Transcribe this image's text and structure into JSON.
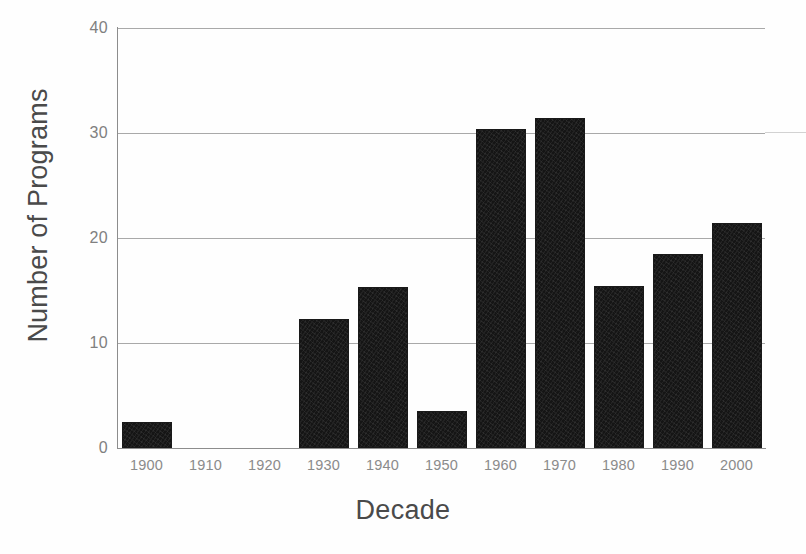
{
  "chart_data": {
    "type": "bar",
    "title": "",
    "xlabel": "Decade",
    "ylabel": "Number of Programs",
    "categories": [
      "1900",
      "1910",
      "1920",
      "1930",
      "1940",
      "1950",
      "1960",
      "1970",
      "1980",
      "1990",
      "2000"
    ],
    "values": [
      2.5,
      0,
      0,
      12.3,
      15.3,
      3.5,
      30.4,
      31.4,
      15.4,
      18.5,
      21.4
    ],
    "ylim": [
      0,
      40
    ],
    "yticks": [
      0,
      10,
      20,
      30,
      40
    ],
    "ytick_labels": [
      "0",
      "10",
      "20",
      "30",
      "40"
    ],
    "grid": "horizontal",
    "legend": "none",
    "bar_color": "#151515",
    "gridline_color": "#9a9a9a",
    "axis_color": "#8d8d8d",
    "tick_label_color": "#808080",
    "axis_title_color": "#4a4a4a",
    "background": "#ffffff"
  },
  "annotations": {
    "gridline_overshoot_note": ""
  }
}
